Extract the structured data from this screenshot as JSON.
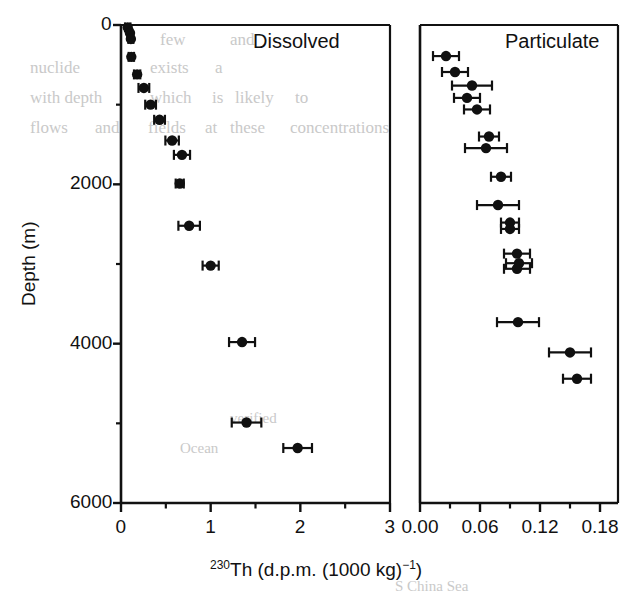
{
  "figure": {
    "x_axis_title_pre": "230",
    "x_axis_title_main": "Th (d.p.m. (1000 kg)",
    "x_axis_title_sup": "−1",
    "x_axis_title_post": ")",
    "y_axis_title": "Depth (m)",
    "ink_color": "#111111",
    "marker_color": "#101010"
  },
  "background_text": [
    {
      "text": "few",
      "x": 160,
      "y": 30,
      "size": 17
    },
    {
      "text": "and",
      "x": 230,
      "y": 30,
      "size": 17
    },
    {
      "text": "nuclide",
      "x": 30,
      "y": 58,
      "size": 17
    },
    {
      "text": "exists",
      "x": 150,
      "y": 58,
      "size": 17
    },
    {
      "text": "a",
      "x": 215,
      "y": 58,
      "size": 17
    },
    {
      "text": "with depth",
      "x": 30,
      "y": 88,
      "size": 17
    },
    {
      "text": "which",
      "x": 150,
      "y": 88,
      "size": 17
    },
    {
      "text": "is",
      "x": 212,
      "y": 88,
      "size": 17
    },
    {
      "text": "likely",
      "x": 235,
      "y": 88,
      "size": 17
    },
    {
      "text": "to",
      "x": 295,
      "y": 88,
      "size": 17
    },
    {
      "text": "flows",
      "x": 30,
      "y": 118,
      "size": 17
    },
    {
      "text": "and",
      "x": 95,
      "y": 118,
      "size": 17
    },
    {
      "text": "fields",
      "x": 148,
      "y": 118,
      "size": 17
    },
    {
      "text": "at",
      "x": 205,
      "y": 118,
      "size": 17
    },
    {
      "text": "these",
      "x": 230,
      "y": 118,
      "size": 17
    },
    {
      "text": "concentrations",
      "x": 290,
      "y": 118,
      "size": 17
    },
    {
      "text": "verified",
      "x": 230,
      "y": 410,
      "size": 15
    },
    {
      "text": "Ocean",
      "x": 180,
      "y": 440,
      "size": 15
    },
    {
      "text": "S China Sea",
      "x": 395,
      "y": 578,
      "size": 15
    }
  ],
  "chart_data": {
    "type": "scatter",
    "title": "",
    "xlabel": "230Th (d.p.m. (1000 kg)-1)",
    "ylabel": "Depth (m)",
    "y_inverted": true,
    "ylim": [
      0,
      6000
    ],
    "y_major_ticks": [
      0,
      2000,
      4000,
      6000
    ],
    "y_minor_ticks": [
      1000,
      3000,
      5000
    ],
    "y_tick_labels": [
      "0",
      "2000",
      "4000",
      "6000"
    ],
    "grid": false,
    "legend": "none",
    "panels": [
      {
        "name": "dissolved",
        "label": "Dissolved",
        "label_position": "top-right",
        "xlim": [
          0,
          3
        ],
        "x_major_ticks": [
          0,
          1,
          2,
          3
        ],
        "x_tick_labels": [
          "0",
          "1",
          "2",
          "3"
        ],
        "x_minor_ticks": [
          0.5,
          1.5,
          2.5
        ],
        "series": [
          {
            "name": "Dissolved 230Th",
            "x": [
              0.07,
              0.1,
              0.11,
              0.12,
              0.18,
              0.26,
              0.33,
              0.42,
              0.57,
              0.69,
              0.66,
              0.76,
              1.0,
              1.35,
              1.4,
              1.97
            ],
            "x_err": [
              0.03,
              0.03,
              0.03,
              0.03,
              0.04,
              0.04,
              0.07,
              0.07,
              0.08,
              0.08,
              0.05,
              0.12,
              0.09,
              0.14,
              0.16,
              0.16
            ],
            "depth": [
              25,
              100,
              175,
              400,
              620,
              790,
              1000,
              1180,
              1430,
              1620,
              1990,
              2180,
              2510,
              3010,
              3980,
              4980,
              5300
            ]
          }
        ]
      },
      {
        "name": "particulate",
        "label": "Particulate",
        "label_position": "top-right",
        "xlim": [
          0.0,
          0.195
        ],
        "x_major_ticks": [
          0.0,
          0.06,
          0.12,
          0.18
        ],
        "x_tick_labels": [
          "0.00",
          "0.06",
          "0.12",
          "0.18"
        ],
        "x_minor_ticks": [
          0.03,
          0.09,
          0.15
        ],
        "series": [
          {
            "name": "Particulate 230Th",
            "x": [
              0.026,
              0.035,
              0.052,
              0.047,
              0.057,
              0.069,
              0.066,
              0.081,
              0.078,
              0.09,
              0.09,
              0.097,
              0.099,
              0.098,
              0.1,
              0.155
            ],
            "x_err": [
              0.012,
              0.012,
              0.02,
              0.012,
              0.012,
              0.01,
              0.02,
              0.01,
              0.02,
              0.009,
              0.009,
              0.013,
              0.013,
              0.013,
              0.02,
              0.015
            ],
            "depth": [
              390,
              580,
              760,
              910,
              1060,
              1400,
              1540,
              1900,
              2260,
              2470,
              2560,
              2870,
              2980,
              3050,
              3730,
              4100,
              4440
            ]
          }
        ]
      }
    ]
  },
  "points": {
    "dissolved": [
      {
        "depth": 30,
        "value": 0.075,
        "err": 0.03
      },
      {
        "depth": 100,
        "value": 0.1,
        "err": 0.025
      },
      {
        "depth": 175,
        "value": 0.11,
        "err": 0.028
      },
      {
        "depth": 400,
        "value": 0.115,
        "err": 0.03
      },
      {
        "depth": 620,
        "value": 0.18,
        "err": 0.035
      },
      {
        "depth": 790,
        "value": 0.255,
        "err": 0.06
      },
      {
        "depth": 1000,
        "value": 0.33,
        "err": 0.06
      },
      {
        "depth": 1190,
        "value": 0.43,
        "err": 0.06
      },
      {
        "depth": 1450,
        "value": 0.57,
        "err": 0.075
      },
      {
        "depth": 1630,
        "value": 0.68,
        "err": 0.09
      },
      {
        "depth": 1990,
        "value": 0.655,
        "err": 0.045
      },
      {
        "depth": 2520,
        "value": 0.76,
        "err": 0.12
      },
      {
        "depth": 3020,
        "value": 1.0,
        "err": 0.09
      },
      {
        "depth": 3980,
        "value": 1.35,
        "err": 0.145
      },
      {
        "depth": 4990,
        "value": 1.4,
        "err": 0.165
      },
      {
        "depth": 5310,
        "value": 1.97,
        "err": 0.16
      }
    ],
    "particulate": [
      {
        "depth": 390,
        "value": 0.026,
        "err": 0.013
      },
      {
        "depth": 590,
        "value": 0.035,
        "err": 0.013
      },
      {
        "depth": 760,
        "value": 0.052,
        "err": 0.02
      },
      {
        "depth": 915,
        "value": 0.047,
        "err": 0.013
      },
      {
        "depth": 1060,
        "value": 0.057,
        "err": 0.013
      },
      {
        "depth": 1400,
        "value": 0.069,
        "err": 0.01
      },
      {
        "depth": 1545,
        "value": 0.066,
        "err": 0.021
      },
      {
        "depth": 1905,
        "value": 0.081,
        "err": 0.01
      },
      {
        "depth": 2260,
        "value": 0.078,
        "err": 0.021
      },
      {
        "depth": 2480,
        "value": 0.09,
        "err": 0.009
      },
      {
        "depth": 2560,
        "value": 0.09,
        "err": 0.009
      },
      {
        "depth": 2870,
        "value": 0.097,
        "err": 0.013
      },
      {
        "depth": 2990,
        "value": 0.099,
        "err": 0.013
      },
      {
        "depth": 3060,
        "value": 0.097,
        "err": 0.013
      },
      {
        "depth": 3730,
        "value": 0.098,
        "err": 0.021
      },
      {
        "depth": 4110,
        "value": 0.15,
        "err": 0.021
      },
      {
        "depth": 4440,
        "value": 0.157,
        "err": 0.014
      }
    ]
  }
}
